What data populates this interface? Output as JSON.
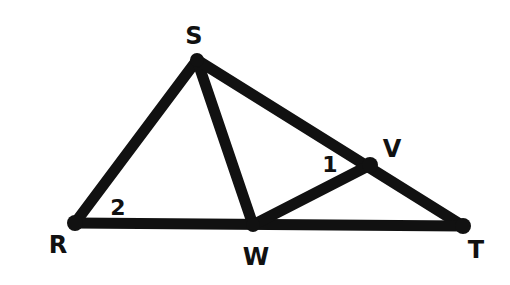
{
  "figure": {
    "type": "geometry-diagram",
    "stroke_color": "#111111",
    "background": "#ffffff",
    "points": {
      "S": {
        "label": "S",
        "x": 197,
        "y": 60,
        "label_x": 194,
        "label_y": 36
      },
      "R": {
        "label": "R",
        "x": 75,
        "y": 223,
        "label_x": 58,
        "label_y": 245
      },
      "W": {
        "label": "W",
        "x": 253,
        "y": 225,
        "label_x": 256,
        "label_y": 257
      },
      "V": {
        "label": "V",
        "x": 370,
        "y": 165,
        "label_x": 392,
        "label_y": 149
      },
      "T": {
        "label": "T",
        "x": 463,
        "y": 226,
        "label_x": 476,
        "label_y": 250
      }
    },
    "segments": [
      {
        "name": "segment-SR",
        "from": "S",
        "to": "R"
      },
      {
        "name": "segment-SW",
        "from": "S",
        "to": "W"
      },
      {
        "name": "segment-ST",
        "from": "S",
        "to": "T"
      },
      {
        "name": "segment-RT",
        "from": "R",
        "to": "T"
      },
      {
        "name": "segment-WV",
        "from": "W",
        "to": "V"
      }
    ],
    "angle_labels": [
      {
        "name": "angle-1",
        "text": "1",
        "x": 330,
        "y": 165,
        "description": "angle SVW at V"
      },
      {
        "name": "angle-2",
        "text": "2",
        "x": 118,
        "y": 208,
        "description": "angle SRW at R"
      }
    ]
  }
}
